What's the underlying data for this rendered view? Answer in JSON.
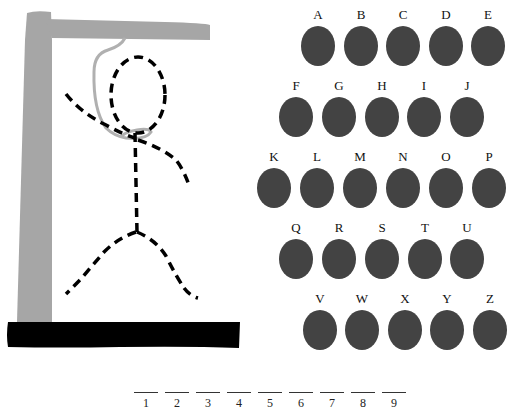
{
  "game": {
    "title": "Hangman",
    "word_length": 9,
    "colors": {
      "gallows": "#a6a6a6",
      "base": "#000000",
      "rope": "#b0b0b0",
      "figure": "#000000",
      "letter_disc": "#434343",
      "text": "#111111"
    }
  },
  "hangman": {
    "parts_shown": [
      "head",
      "body",
      "left-arm",
      "right-arm",
      "left-leg",
      "right-leg",
      "rope"
    ]
  },
  "letters": {
    "rows": [
      [
        {
          "label": "A",
          "x": 296,
          "y": 8
        },
        {
          "label": "B",
          "x": 339,
          "y": 8
        },
        {
          "label": "C",
          "x": 381,
          "y": 8
        },
        {
          "label": "D",
          "x": 424,
          "y": 8
        },
        {
          "label": "E",
          "x": 466,
          "y": 8
        }
      ],
      [
        {
          "label": "F",
          "x": 274,
          "y": 79
        },
        {
          "label": "G",
          "x": 317,
          "y": 79
        },
        {
          "label": "H",
          "x": 360,
          "y": 79
        },
        {
          "label": "I",
          "x": 402,
          "y": 79
        },
        {
          "label": "J",
          "x": 445,
          "y": 79
        }
      ],
      [
        {
          "label": "K",
          "x": 252,
          "y": 150
        },
        {
          "label": "L",
          "x": 295,
          "y": 150
        },
        {
          "label": "M",
          "x": 338,
          "y": 150
        },
        {
          "label": "N",
          "x": 381,
          "y": 150
        },
        {
          "label": "O",
          "x": 424,
          "y": 150
        },
        {
          "label": "P",
          "x": 467,
          "y": 150
        }
      ],
      [
        {
          "label": "Q",
          "x": 274,
          "y": 221
        },
        {
          "label": "R",
          "x": 317,
          "y": 221
        },
        {
          "label": "S",
          "x": 360,
          "y": 221
        },
        {
          "label": "T",
          "x": 403,
          "y": 221
        },
        {
          "label": "U",
          "x": 445,
          "y": 221
        }
      ],
      [
        {
          "label": "V",
          "x": 298,
          "y": 292
        },
        {
          "label": "W",
          "x": 340,
          "y": 292
        },
        {
          "label": "X",
          "x": 383,
          "y": 292
        },
        {
          "label": "Y",
          "x": 425,
          "y": 292
        },
        {
          "label": "Z",
          "x": 468,
          "y": 292
        }
      ]
    ]
  },
  "blanks": [
    {
      "num": "1",
      "x": 134
    },
    {
      "num": "2",
      "x": 165
    },
    {
      "num": "3",
      "x": 196
    },
    {
      "num": "4",
      "x": 227
    },
    {
      "num": "5",
      "x": 258
    },
    {
      "num": "6",
      "x": 289
    },
    {
      "num": "7",
      "x": 320
    },
    {
      "num": "8",
      "x": 351
    },
    {
      "num": "9",
      "x": 382
    }
  ]
}
